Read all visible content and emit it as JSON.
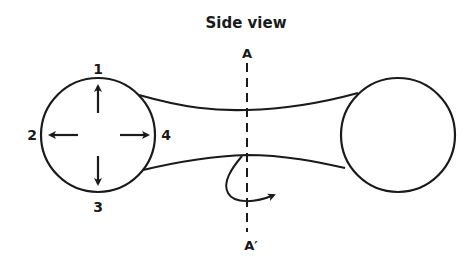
{
  "diagram": {
    "title": "Side view",
    "section_labels": {
      "top": "A",
      "bottom": "A′"
    },
    "direction_labels": {
      "up": "1",
      "left": "2",
      "down": "3",
      "right": "4"
    },
    "stroke_color": "#1a1a1a",
    "background_color": "#ffffff",
    "shapes": {
      "left_circle": {
        "cx": 98,
        "cy": 135,
        "r": 57
      },
      "right_circle": {
        "cx": 398,
        "cy": 135,
        "r": 57
      },
      "section_line": {
        "x": 247,
        "y1": 62,
        "y2": 232,
        "style": "dashed"
      }
    },
    "arrows": [
      {
        "id": "1",
        "direction": "up"
      },
      {
        "id": "2",
        "direction": "left"
      },
      {
        "id": "3",
        "direction": "down"
      },
      {
        "id": "4",
        "direction": "right"
      },
      {
        "id": "rotation",
        "direction": "curved-clockwise-around-section-line"
      }
    ]
  }
}
